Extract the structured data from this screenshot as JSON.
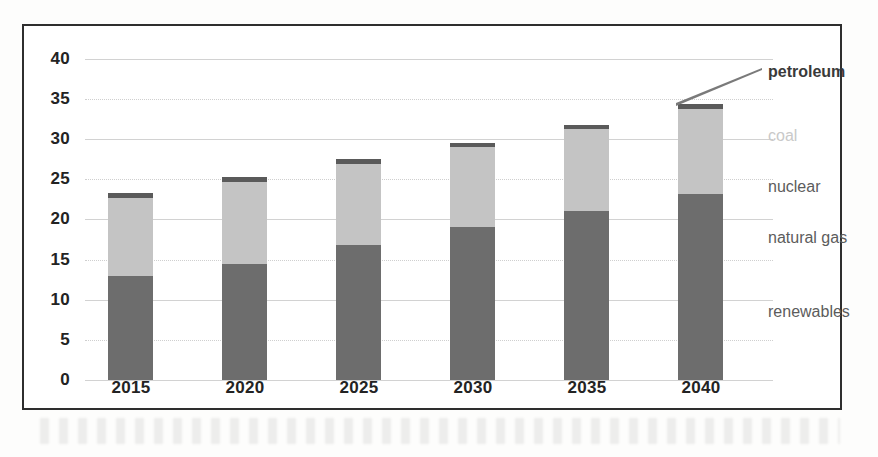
{
  "figure": {
    "frame_color": "#2e2e2e",
    "background": "#ffffff"
  },
  "axis_labels": {
    "y_ticks": [
      "40",
      "35",
      "30",
      "25",
      "20",
      "15",
      "10",
      "5",
      "0"
    ],
    "x_ticks": [
      "2015",
      "2020",
      "2025",
      "2030",
      "2035",
      "2040"
    ]
  },
  "series_labels": [
    {
      "name": "petroleum",
      "text": "petroleum",
      "color": "#3a3a3a",
      "style": "dark"
    },
    {
      "name": "coal",
      "text": "coal",
      "color": "#c9c9c9",
      "style": "faint"
    },
    {
      "name": "nuclear",
      "text": "nuclear",
      "color": "#5c5c5c",
      "style": "normal"
    },
    {
      "name": "natural-gas",
      "text": "natural gas",
      "color": "#5c5c5c",
      "style": "normal"
    },
    {
      "name": "renewables",
      "text": "renewables",
      "color": "#5c5c5c",
      "style": "normal"
    }
  ],
  "chart_data": {
    "type": "bar",
    "subtype": "stacked",
    "title": "",
    "xlabel": "",
    "ylabel": "",
    "categories": [
      "2015",
      "2020",
      "2025",
      "2030",
      "2035",
      "2040"
    ],
    "ylim": [
      0,
      40
    ],
    "ytick_step": 5,
    "grid": true,
    "legend_position": "right-inline-labels",
    "series": [
      {
        "name": "renewables",
        "color": "#6d6d6d",
        "values": [
          13.0,
          14.5,
          16.8,
          19.1,
          21.1,
          23.2
        ]
      },
      {
        "name": "natural gas",
        "color": "#6d6d6d",
        "values": [
          0,
          0,
          0,
          0,
          0,
          0
        ]
      },
      {
        "name": "nuclear",
        "color": "#c4c4c4",
        "values": [
          0,
          0,
          0,
          0,
          0,
          0
        ]
      },
      {
        "name": "coal",
        "color": "#c4c4c4",
        "values": [
          9.7,
          10.2,
          10.1,
          9.9,
          10.1,
          10.6
        ]
      },
      {
        "name": "petroleum",
        "color": "#5a5a5a",
        "values": [
          0.6,
          0.6,
          0.6,
          0.5,
          0.6,
          0.6
        ]
      }
    ],
    "totals": [
      23.3,
      25.3,
      27.5,
      29.5,
      31.8,
      34.4
    ]
  },
  "geometry": {
    "baseline_y": 354,
    "px_per_unit": 8.03,
    "bar_width": 45,
    "bar_lefts": [
      84,
      198,
      312,
      426,
      540,
      654
    ],
    "label_x": 768,
    "label_ys": [
      72,
      136,
      187,
      238,
      312
    ],
    "leader_line": {
      "x1": 676,
      "y1": 100,
      "x2": 762,
      "y2": 68
    }
  }
}
